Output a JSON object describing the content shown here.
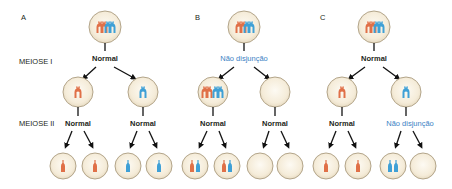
{
  "panels": [
    {
      "letter": "A",
      "meiosis1": "Normal",
      "meiosis2_left": "Normal",
      "meiosis2_right": "Normal"
    },
    {
      "letter": "B",
      "meiosis1": "Não disjunção",
      "meiosis2_left": "Normal",
      "meiosis2_right": "Normal"
    },
    {
      "letter": "C",
      "meiosis1": "Normal",
      "meiosis2_left": "Normal",
      "meiosis2_right": "Não disjunção"
    }
  ],
  "row_labels": {
    "meiosis1": "MEIOSE I",
    "meiosis2": "MEIOSE II"
  },
  "colors": {
    "maternal": "#e07048",
    "paternal": "#3fa0d6",
    "cell_fill": "#f7efe0",
    "cell_border": "#b3a58a",
    "nondisjunction_text": "#3b82c4",
    "text": "#231f20"
  }
}
